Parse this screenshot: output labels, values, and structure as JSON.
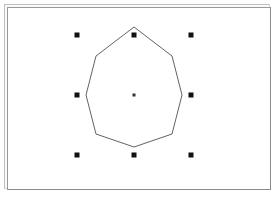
{
  "window": {
    "title": "Drawing Canvas",
    "frame_style": "beveled-double-border",
    "background_color": "#ffffff",
    "frame_light_color": "#bfbfbf",
    "frame_shadow_color": "#8c8c8c"
  },
  "canvas": {
    "width": 262,
    "height": 181,
    "background_color": "#ffffff"
  },
  "shape": {
    "name": "octagon",
    "type": "regular-polygon",
    "sides": 8,
    "selected": true,
    "stroke_color": "#3b3b3b",
    "fill": "none",
    "stroke_width": 0.8,
    "center": {
      "x": 134,
      "y": 95
    },
    "vertices": [
      {
        "x": 134,
        "y": 27
      },
      {
        "x": 172,
        "y": 56
      },
      {
        "x": 182,
        "y": 95
      },
      {
        "x": 172,
        "y": 134
      },
      {
        "x": 134,
        "y": 147
      },
      {
        "x": 96,
        "y": 134
      },
      {
        "x": 86,
        "y": 95
      },
      {
        "x": 96,
        "y": 56
      }
    ]
  },
  "selection": {
    "handle_color": "#111111",
    "handle_size": 5,
    "center_handle_size": 3,
    "bounding_box": {
      "x": 77,
      "y": 35,
      "width": 114,
      "height": 120
    },
    "handles": [
      {
        "name": "handle-top-left",
        "x": 77,
        "y": 35,
        "cursor": "nwse-resize"
      },
      {
        "name": "handle-top-center",
        "x": 134,
        "y": 35,
        "cursor": "ns-resize"
      },
      {
        "name": "handle-top-right",
        "x": 191,
        "y": 35,
        "cursor": "nesw-resize"
      },
      {
        "name": "handle-middle-left",
        "x": 77,
        "y": 95,
        "cursor": "ew-resize"
      },
      {
        "name": "handle-middle-right",
        "x": 191,
        "y": 95,
        "cursor": "ew-resize"
      },
      {
        "name": "handle-bottom-left",
        "x": 77,
        "y": 155,
        "cursor": "nesw-resize"
      },
      {
        "name": "handle-bottom-center",
        "x": 134,
        "y": 155,
        "cursor": "ns-resize"
      },
      {
        "name": "handle-bottom-right",
        "x": 191,
        "y": 155,
        "cursor": "nwse-resize"
      }
    ],
    "center_handle": {
      "name": "handle-rotation-center",
      "x": 134,
      "y": 95
    }
  }
}
